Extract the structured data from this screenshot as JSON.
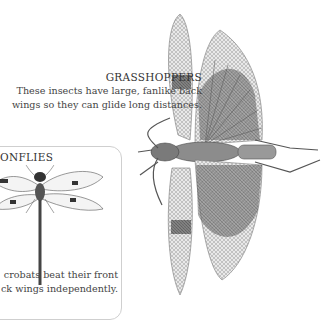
{
  "grasshopper": {
    "title": "GRASSHOPPERS",
    "description_line1": "These insects have large, fanlike back",
    "description_line2": "wings so they can glide long distances."
  },
  "dragonfly": {
    "title": "ONFLIES",
    "description_line1": "crobats beat their front",
    "description_line2": "ck wings independently."
  }
}
